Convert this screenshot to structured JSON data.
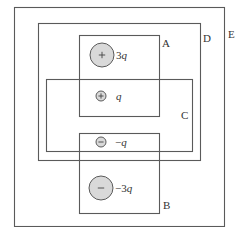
{
  "diagram": {
    "type": "gauss-law-surfaces",
    "colors": {
      "surface_stroke": "#5a5a5a",
      "charge_fill": "#d9d9d9",
      "background": "#ffffff",
      "text": "#333333"
    },
    "surfaces": [
      {
        "id": "E",
        "label": "E",
        "x": 14,
        "y": 7,
        "w": 210,
        "h": 219,
        "label_x": 228,
        "label_y": 38
      },
      {
        "id": "D",
        "label": "D",
        "x": 38,
        "y": 23,
        "w": 162,
        "h": 137,
        "label_x": 203,
        "label_y": 42
      },
      {
        "id": "A",
        "label": "A",
        "x": 79,
        "y": 35,
        "w": 80,
        "h": 81,
        "label_x": 162,
        "label_y": 47
      },
      {
        "id": "C",
        "label": "C",
        "x": 46,
        "y": 79,
        "w": 146,
        "h": 72,
        "label_x": 181,
        "label_y": 119
      },
      {
        "id": "B",
        "label": "B",
        "x": 79,
        "y": 133,
        "w": 80,
        "h": 80,
        "label_x": 163,
        "label_y": 209
      }
    ],
    "charges": [
      {
        "id": "q1",
        "sign": "+",
        "label_coef": "3",
        "label_var": "q",
        "cx": 102,
        "cy": 55,
        "r": 12,
        "label_x": 116,
        "label_y": 59
      },
      {
        "id": "q2",
        "sign": "+",
        "label_coef": "",
        "label_var": "q",
        "cx": 101,
        "cy": 96,
        "r": 5,
        "label_x": 116,
        "label_y": 100
      },
      {
        "id": "q3",
        "sign": "−",
        "label_coef": "−",
        "label_var": "q",
        "cx": 101,
        "cy": 142,
        "r": 5,
        "label_x": 115,
        "label_y": 146
      },
      {
        "id": "q4",
        "sign": "−",
        "label_coef": "−3",
        "label_var": "q",
        "cx": 101,
        "cy": 188,
        "r": 12,
        "label_x": 115,
        "label_y": 192
      }
    ]
  }
}
